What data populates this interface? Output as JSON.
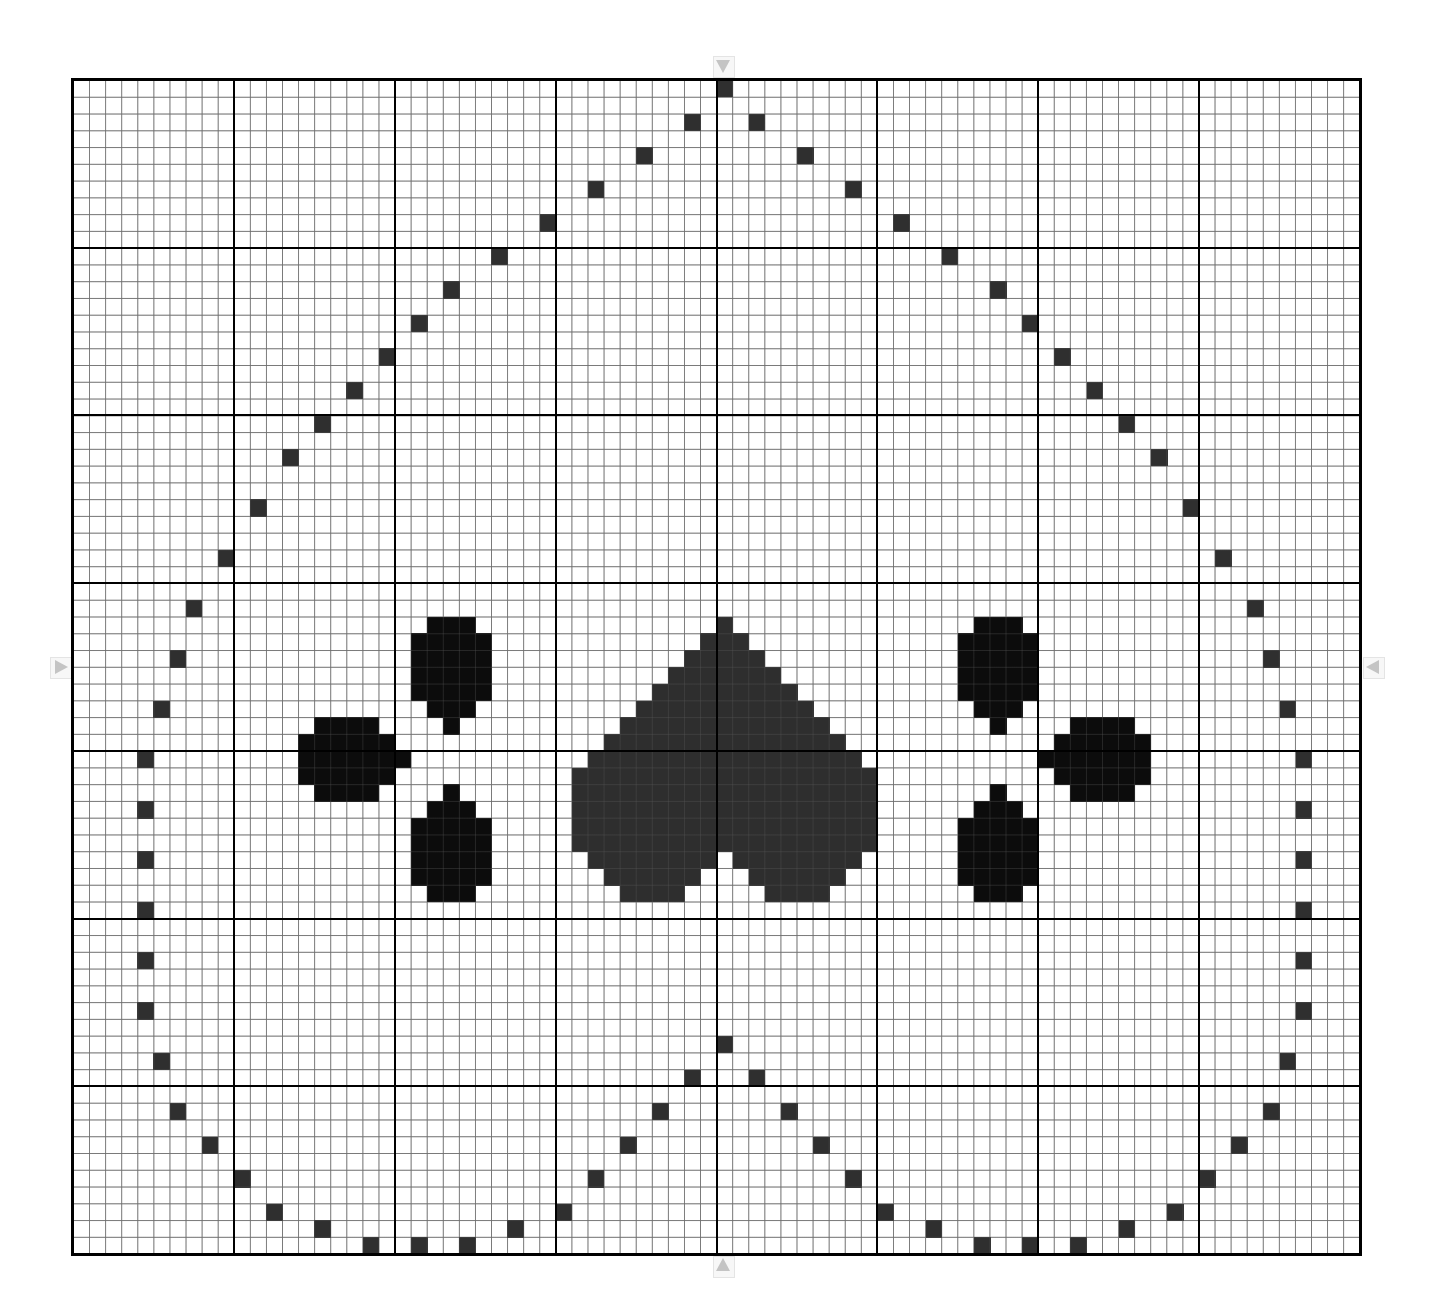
{
  "pattern": {
    "title": "",
    "grid": {
      "columns": 80,
      "rows": 70,
      "major_every": 10
    },
    "center": {
      "column": 40,
      "row": 35
    },
    "colors": {
      "background": "#ffffff",
      "minor_grid": "#8a8a8a",
      "major_grid": "#000000",
      "heart": "#2e2e2e",
      "toe": "#0c0c0c",
      "dot": "#2f2f2f",
      "center_marker": "#c4c4c4"
    },
    "center_markers": [
      "arrow-top",
      "arrow-bottom",
      "arrow-left",
      "arrow-right"
    ],
    "heart_pad_rows": [
      {
        "row": 32,
        "spans": [
          [
            40,
            40
          ]
        ]
      },
      {
        "row": 33,
        "spans": [
          [
            39,
            41
          ]
        ]
      },
      {
        "row": 34,
        "spans": [
          [
            38,
            42
          ]
        ]
      },
      {
        "row": 35,
        "spans": [
          [
            37,
            43
          ]
        ]
      },
      {
        "row": 36,
        "spans": [
          [
            36,
            44
          ]
        ]
      },
      {
        "row": 37,
        "spans": [
          [
            35,
            45
          ]
        ]
      },
      {
        "row": 38,
        "spans": [
          [
            34,
            46
          ]
        ]
      },
      {
        "row": 39,
        "spans": [
          [
            33,
            47
          ]
        ]
      },
      {
        "row": 40,
        "spans": [
          [
            32,
            48
          ]
        ]
      },
      {
        "row": 41,
        "spans": [
          [
            31,
            49
          ]
        ]
      },
      {
        "row": 42,
        "spans": [
          [
            31,
            49
          ]
        ]
      },
      {
        "row": 43,
        "spans": [
          [
            31,
            49
          ]
        ]
      },
      {
        "row": 44,
        "spans": [
          [
            31,
            49
          ]
        ]
      },
      {
        "row": 45,
        "spans": [
          [
            31,
            49
          ]
        ]
      },
      {
        "row": 46,
        "spans": [
          [
            32,
            39
          ],
          [
            41,
            48
          ]
        ]
      },
      {
        "row": 47,
        "spans": [
          [
            33,
            38
          ],
          [
            42,
            47
          ]
        ]
      },
      {
        "row": 48,
        "spans": [
          [
            34,
            37
          ],
          [
            43,
            46
          ]
        ]
      }
    ],
    "toes": [
      {
        "name": "toe-upper-left",
        "rows": [
          {
            "row": 32,
            "spans": [
              [
                22,
                24
              ]
            ]
          },
          {
            "row": 33,
            "spans": [
              [
                21,
                25
              ]
            ]
          },
          {
            "row": 34,
            "spans": [
              [
                21,
                25
              ]
            ]
          },
          {
            "row": 35,
            "spans": [
              [
                21,
                25
              ]
            ]
          },
          {
            "row": 36,
            "spans": [
              [
                21,
                25
              ]
            ]
          },
          {
            "row": 37,
            "spans": [
              [
                22,
                24
              ]
            ]
          },
          {
            "row": 38,
            "spans": [
              [
                23,
                23
              ]
            ]
          }
        ]
      },
      {
        "name": "toe-left",
        "rows": [
          {
            "row": 38,
            "spans": [
              [
                15,
                18
              ]
            ]
          },
          {
            "row": 39,
            "spans": [
              [
                14,
                19
              ]
            ]
          },
          {
            "row": 40,
            "spans": [
              [
                14,
                20
              ]
            ]
          },
          {
            "row": 41,
            "spans": [
              [
                14,
                19
              ]
            ]
          },
          {
            "row": 42,
            "spans": [
              [
                15,
                18
              ]
            ]
          }
        ]
      },
      {
        "name": "toe-lower-left",
        "rows": [
          {
            "row": 42,
            "spans": [
              [
                23,
                23
              ]
            ]
          },
          {
            "row": 43,
            "spans": [
              [
                22,
                24
              ]
            ]
          },
          {
            "row": 44,
            "spans": [
              [
                21,
                25
              ]
            ]
          },
          {
            "row": 45,
            "spans": [
              [
                21,
                25
              ]
            ]
          },
          {
            "row": 46,
            "spans": [
              [
                21,
                25
              ]
            ]
          },
          {
            "row": 47,
            "spans": [
              [
                21,
                25
              ]
            ]
          },
          {
            "row": 48,
            "spans": [
              [
                22,
                24
              ]
            ]
          }
        ]
      },
      {
        "name": "toe-upper-right",
        "rows": [
          {
            "row": 32,
            "spans": [
              [
                56,
                58
              ]
            ]
          },
          {
            "row": 33,
            "spans": [
              [
                55,
                59
              ]
            ]
          },
          {
            "row": 34,
            "spans": [
              [
                55,
                59
              ]
            ]
          },
          {
            "row": 35,
            "spans": [
              [
                55,
                59
              ]
            ]
          },
          {
            "row": 36,
            "spans": [
              [
                55,
                59
              ]
            ]
          },
          {
            "row": 37,
            "spans": [
              [
                56,
                58
              ]
            ]
          },
          {
            "row": 38,
            "spans": [
              [
                57,
                57
              ]
            ]
          }
        ]
      },
      {
        "name": "toe-right",
        "rows": [
          {
            "row": 38,
            "spans": [
              [
                62,
                65
              ]
            ]
          },
          {
            "row": 39,
            "spans": [
              [
                61,
                66
              ]
            ]
          },
          {
            "row": 40,
            "spans": [
              [
                60,
                66
              ]
            ]
          },
          {
            "row": 41,
            "spans": [
              [
                61,
                66
              ]
            ]
          },
          {
            "row": 42,
            "spans": [
              [
                62,
                65
              ]
            ]
          }
        ]
      },
      {
        "name": "toe-lower-right",
        "rows": [
          {
            "row": 42,
            "spans": [
              [
                57,
                57
              ]
            ]
          },
          {
            "row": 43,
            "spans": [
              [
                56,
                58
              ]
            ]
          },
          {
            "row": 44,
            "spans": [
              [
                55,
                59
              ]
            ]
          },
          {
            "row": 45,
            "spans": [
              [
                55,
                59
              ]
            ]
          },
          {
            "row": 46,
            "spans": [
              [
                55,
                59
              ]
            ]
          },
          {
            "row": 47,
            "spans": [
              [
                55,
                59
              ]
            ]
          },
          {
            "row": 48,
            "spans": [
              [
                56,
                58
              ]
            ]
          }
        ]
      }
    ],
    "outline_dots": [
      [
        40,
        0
      ],
      [
        38,
        2
      ],
      [
        42,
        2
      ],
      [
        35,
        4
      ],
      [
        45,
        4
      ],
      [
        32,
        6
      ],
      [
        48,
        6
      ],
      [
        29,
        8
      ],
      [
        51,
        8
      ],
      [
        26,
        10
      ],
      [
        54,
        10
      ],
      [
        23,
        12
      ],
      [
        57,
        12
      ],
      [
        21,
        14
      ],
      [
        59,
        14
      ],
      [
        19,
        16
      ],
      [
        61,
        16
      ],
      [
        17,
        18
      ],
      [
        63,
        18
      ],
      [
        15,
        20
      ],
      [
        65,
        20
      ],
      [
        13,
        22
      ],
      [
        67,
        22
      ],
      [
        11,
        25
      ],
      [
        69,
        25
      ],
      [
        9,
        28
      ],
      [
        71,
        28
      ],
      [
        7,
        31
      ],
      [
        73,
        31
      ],
      [
        6,
        34
      ],
      [
        74,
        34
      ],
      [
        5,
        37
      ],
      [
        75,
        37
      ],
      [
        4,
        40
      ],
      [
        76,
        40
      ],
      [
        4,
        43
      ],
      [
        76,
        43
      ],
      [
        4,
        46
      ],
      [
        76,
        46
      ],
      [
        4,
        49
      ],
      [
        76,
        49
      ],
      [
        4,
        52
      ],
      [
        76,
        52
      ],
      [
        4,
        55
      ],
      [
        76,
        55
      ],
      [
        5,
        58
      ],
      [
        75,
        58
      ],
      [
        6,
        61
      ],
      [
        74,
        61
      ],
      [
        8,
        63
      ],
      [
        72,
        63
      ],
      [
        10,
        65
      ],
      [
        70,
        65
      ],
      [
        12,
        67
      ],
      [
        68,
        67
      ],
      [
        15,
        68
      ],
      [
        65,
        68
      ],
      [
        18,
        69
      ],
      [
        62,
        69
      ],
      [
        21,
        69
      ],
      [
        59,
        69
      ],
      [
        24,
        69
      ],
      [
        56,
        69
      ],
      [
        27,
        68
      ],
      [
        53,
        68
      ],
      [
        30,
        67
      ],
      [
        50,
        67
      ],
      [
        32,
        65
      ],
      [
        48,
        65
      ],
      [
        34,
        63
      ],
      [
        46,
        63
      ],
      [
        36,
        61
      ],
      [
        44,
        61
      ],
      [
        38,
        59
      ],
      [
        42,
        59
      ],
      [
        40,
        57
      ]
    ]
  }
}
